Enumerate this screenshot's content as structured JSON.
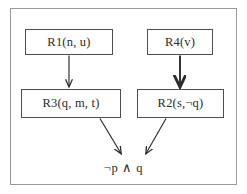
{
  "diagram": {
    "title_visible": false,
    "frame": {
      "border_color": "#9a9a9a"
    },
    "colors": {
      "node_border": "#4f4f4f",
      "node_fill": "#ffffff",
      "text": "#2b2b2b",
      "arrow": "#2b2b2b",
      "frame_border": "#9a9a9a",
      "background": "#ffffff"
    },
    "nodes": [
      {
        "id": "r1",
        "label": "R1(n, u)"
      },
      {
        "id": "r4",
        "label": "R4(v)"
      },
      {
        "id": "r3",
        "label": "R3(q, m, t)"
      },
      {
        "id": "r2",
        "label": "R2(s,¬q)"
      }
    ],
    "conclusion": {
      "label": "¬p ∧ q"
    },
    "edges": [
      {
        "id": "r1-to-r3",
        "from": "R1(n, u)",
        "to": "R3(q, m, t)",
        "style": "thin-vertical-arrow"
      },
      {
        "id": "r4-to-r2",
        "from": "R4(v)",
        "to": "R2(s,¬q)",
        "style": "bold-vertical-arrow"
      },
      {
        "id": "r3-to-conclusion",
        "from": "R3(q, m, t)",
        "to": "¬p ∧ q",
        "style": "thin-diagonal-arrow"
      },
      {
        "id": "r2-to-conclusion",
        "from": "R2(s,¬q)",
        "to": "¬p ∧ q",
        "style": "thin-diagonal-arrow"
      }
    ]
  }
}
